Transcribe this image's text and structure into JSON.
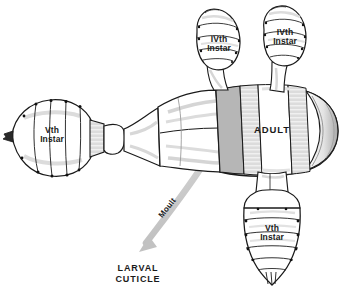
{
  "figure": {
    "background_color": "#ffffff",
    "ink_color": "#1a1a1a",
    "shade_gray": "#c9c9c9",
    "mid_gray": "#a8a8a8",
    "dark_gray": "#8e8e8e",
    "texture_gray": "#cfcfcf",
    "arrow_color": "#c2c2c2"
  },
  "labels": {
    "instar_iv_left": "IVth\nInstar",
    "instar_iv_right": "IVth\nInstar",
    "instar_v_left": "Vth\nInstar",
    "instar_v_bottom": "Vth\nInstar",
    "adult": "ADULT",
    "moult": "Moult",
    "larval_cuticle": "LARVAL\nCUTICLE"
  },
  "parts": [
    {
      "name": "instar-iv-left-body",
      "label": "IVth Instar",
      "position": "upper-left-appendage"
    },
    {
      "name": "instar-iv-right-body",
      "label": "IVth Instar",
      "position": "upper-right-appendage"
    },
    {
      "name": "instar-v-left-body",
      "label": "Vth Instar",
      "position": "far-left-bulb"
    },
    {
      "name": "instar-v-bottom-body",
      "label": "Vth Instar",
      "position": "lower-appendage"
    },
    {
      "name": "adult-body",
      "label": "ADULT",
      "position": "center-right-main-body"
    },
    {
      "name": "moult-arrow",
      "label": "Moult",
      "position": "center-descending-curve"
    },
    {
      "name": "larval-cuticle-caption",
      "label": "LARVAL CUTICLE",
      "position": "bottom-left"
    }
  ]
}
